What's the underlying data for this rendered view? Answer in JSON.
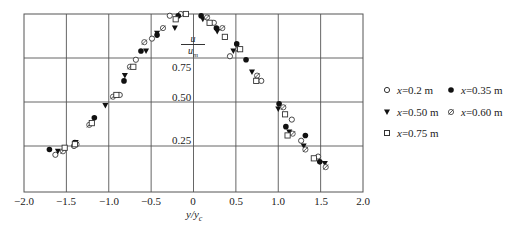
{
  "chart_data": {
    "type": "scatter",
    "title": "",
    "xlabel": "y/y_c",
    "ylabel": "u/u_m",
    "xlim": [
      -2.0,
      2.0
    ],
    "ylim": [
      0,
      1.0
    ],
    "x_ticks": [
      "-2.0",
      "-1.5",
      "-1.0",
      "-0.5",
      "0",
      "0.5",
      "1.0",
      "1.5",
      "2.0"
    ],
    "y_ticks": [
      "0.25",
      "0.50",
      "0.75"
    ],
    "grid": true,
    "legend_position": "right",
    "series": [
      {
        "name": "x=0.2 m",
        "marker": "open-circle",
        "points": [
          [
            -1.63,
            0.2
          ],
          [
            -1.41,
            0.25
          ],
          [
            -0.87,
            0.54
          ],
          [
            -0.68,
            0.74
          ],
          [
            -0.49,
            0.86
          ],
          [
            -0.28,
            0.99
          ],
          [
            -0.15,
            1.0
          ],
          [
            0.24,
            0.95
          ],
          [
            0.43,
            0.76
          ],
          [
            0.8,
            0.62
          ],
          [
            1.16,
            0.4
          ],
          [
            1.27,
            0.28
          ],
          [
            1.47,
            0.19
          ]
        ]
      },
      {
        "name": "x=0.35 m",
        "marker": "filled-circle",
        "points": [
          [
            -1.7,
            0.23
          ],
          [
            -1.4,
            0.27
          ],
          [
            -1.17,
            0.41
          ],
          [
            -0.82,
            0.62
          ],
          [
            -0.62,
            0.79
          ],
          [
            -0.43,
            0.88
          ],
          [
            -0.18,
            0.99
          ],
          [
            0.09,
            0.99
          ],
          [
            0.27,
            0.92
          ],
          [
            0.51,
            0.83
          ],
          [
            0.62,
            0.74
          ],
          [
            1.01,
            0.49
          ],
          [
            1.09,
            0.36
          ],
          [
            1.32,
            0.31
          ],
          [
            1.49,
            0.16
          ]
        ]
      },
      {
        "name": "x=0.50 m",
        "marker": "filled-triangle-down",
        "points": [
          [
            -1.6,
            0.22
          ],
          [
            -1.39,
            0.27
          ],
          [
            -1.04,
            0.48
          ],
          [
            -0.81,
            0.65
          ],
          [
            -0.56,
            0.79
          ],
          [
            -0.43,
            0.89
          ],
          [
            -0.22,
            0.92
          ],
          [
            0.11,
            0.97
          ],
          [
            0.28,
            0.9
          ],
          [
            0.47,
            0.79
          ],
          [
            0.69,
            0.67
          ],
          [
            1.0,
            0.46
          ],
          [
            1.13,
            0.33
          ],
          [
            1.3,
            0.25
          ],
          [
            1.55,
            0.15
          ]
        ]
      },
      {
        "name": "x=0.60 m",
        "marker": "slashed-circle",
        "points": [
          [
            -1.54,
            0.22
          ],
          [
            -1.38,
            0.26
          ],
          [
            -1.23,
            0.37
          ],
          [
            -0.95,
            0.53
          ],
          [
            -0.75,
            0.7
          ],
          [
            -0.58,
            0.84
          ],
          [
            -0.36,
            0.92
          ],
          [
            0.16,
            0.98
          ],
          [
            0.34,
            0.92
          ],
          [
            0.53,
            0.8
          ],
          [
            0.75,
            0.65
          ],
          [
            1.06,
            0.47
          ],
          [
            1.17,
            0.32
          ],
          [
            1.32,
            0.23
          ],
          [
            1.56,
            0.13
          ]
        ]
      },
      {
        "name": "x=0.75 m",
        "marker": "open-square",
        "points": [
          [
            -1.52,
            0.24
          ],
          [
            -1.4,
            0.26
          ],
          [
            -1.2,
            0.38
          ],
          [
            -0.91,
            0.54
          ],
          [
            -0.71,
            0.7
          ],
          [
            -0.21,
            0.97
          ],
          [
            -0.09,
            1.0
          ],
          [
            0.19,
            0.95
          ],
          [
            0.37,
            0.87
          ],
          [
            0.55,
            0.8
          ],
          [
            0.74,
            0.62
          ],
          [
            1.08,
            0.43
          ],
          [
            1.11,
            0.31
          ],
          [
            1.42,
            0.18
          ]
        ]
      }
    ]
  },
  "legend": {
    "items": [
      {
        "prefix": "x",
        "label": "=0.2 m"
      },
      {
        "prefix": "x",
        "label": "=0.35 m"
      },
      {
        "prefix": "x",
        "label": "=0.50 m"
      },
      {
        "prefix": "x",
        "label": "=0.60 m"
      },
      {
        "prefix": "x",
        "label": "=0.75 m"
      }
    ]
  },
  "axis": {
    "ylabel_num": "u",
    "ylabel_den": "u",
    "ylabel_den_sub": "m",
    "xlabel_main": "y/y",
    "xlabel_sub": "c",
    "y_ticks": [
      "0.75",
      "0.50",
      "0.25"
    ],
    "x_ticks": [
      "−2.0",
      "−1.5",
      "−1.0",
      "−0.5",
      "0",
      "0.5",
      "1.0",
      "1.5",
      "2.0"
    ]
  }
}
